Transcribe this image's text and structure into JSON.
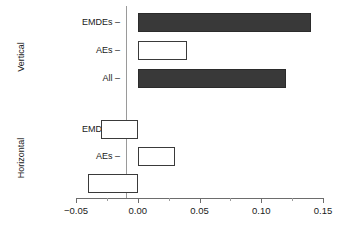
{
  "chart_data": {
    "type": "bar",
    "orientation": "horizontal",
    "title": "",
    "xlabel": "",
    "ylabel": "",
    "xlim": [
      -0.05,
      0.15
    ],
    "grid": false,
    "legend": null,
    "zero_reference_line": true,
    "facets": [
      {
        "name": "Vertical",
        "label": "Vertical",
        "categories": [
          "EMDEs",
          "AEs",
          "All"
        ],
        "values": [
          0.14,
          0.04,
          0.12
        ],
        "fills": [
          "dark",
          "white",
          "dark"
        ]
      },
      {
        "name": "Horizontal",
        "label": "Horizontal",
        "categories": [
          "EMDEs",
          "AEs",
          "All"
        ],
        "values": [
          -0.03,
          0.03,
          -0.04
        ],
        "fills": [
          "white",
          "white",
          "white"
        ]
      }
    ],
    "xticks": [
      -0.05,
      0.0,
      0.05,
      0.1,
      0.15
    ],
    "xticklabels": [
      "−0.05",
      "0.00",
      "0.05",
      "0.10",
      "0.15"
    ],
    "xminorticks": [
      -0.025,
      0.025,
      0.075,
      0.125
    ],
    "colors": {
      "dark_fill": "#393939",
      "white_fill": "#ffffff",
      "bar_outline": "#3a3a3a",
      "axis": "#6d6d6d",
      "zero_line": "#9a9a9a",
      "text": "#1a1a1a"
    }
  },
  "axis": {
    "tick_label_0": "−0.05",
    "tick_label_1": "0.00",
    "tick_label_2": "0.05",
    "tick_label_3": "0.10",
    "tick_label_4": "0.15"
  },
  "facet_titles": {
    "vertical": "Vertical",
    "horizontal": "Horizontal"
  },
  "category_labels": {
    "v_emdes": "EMDEs –",
    "v_aes": "AEs –",
    "v_all": "All –",
    "h_emdes": "EMDEs –",
    "h_aes": "AEs –",
    "h_all": "All –"
  }
}
